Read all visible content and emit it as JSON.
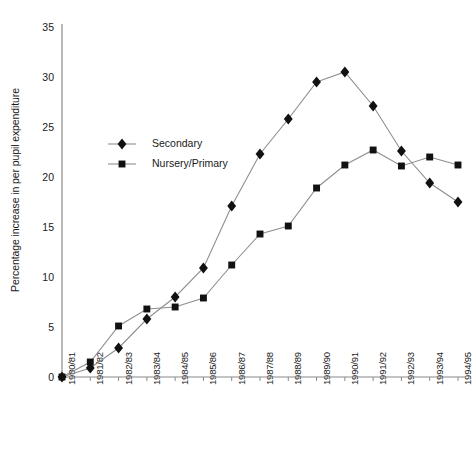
{
  "chart_data": {
    "type": "line",
    "title": "",
    "xlabel": "",
    "ylabel": "Percentage increase in per pupil expenditure",
    "ylim": [
      0,
      35
    ],
    "yticks": [
      0,
      5,
      10,
      15,
      20,
      25,
      30,
      35
    ],
    "grid": false,
    "legend_position": "upper-left-inside",
    "categories": [
      "1980/81",
      "1981/82",
      "1982/83",
      "1983/84",
      "1984/85",
      "1985/86",
      "1986/87",
      "1987/88",
      "1988/89",
      "1989/90",
      "1990/91",
      "1991/92",
      "1992/93",
      "1993/94",
      "1994/95"
    ],
    "series": [
      {
        "name": "Secondary",
        "marker": "diamond",
        "color": "#111111",
        "values": [
          0.0,
          0.9,
          2.9,
          5.8,
          8.0,
          10.9,
          17.1,
          22.3,
          25.8,
          29.5,
          30.5,
          27.1,
          22.6,
          19.4,
          17.5
        ]
      },
      {
        "name": "Nursery/Primary",
        "marker": "square",
        "color": "#111111",
        "values": [
          0.0,
          1.5,
          5.1,
          6.8,
          7.0,
          7.9,
          11.2,
          14.3,
          15.1,
          18.9,
          21.2,
          22.7,
          21.1,
          22.0,
          21.2
        ]
      }
    ],
    "annotations": []
  },
  "legend": {
    "items": [
      {
        "label": "Secondary",
        "marker": "diamond-marker-icon"
      },
      {
        "label": "Nursery/Primary",
        "marker": "square-marker-icon"
      }
    ]
  },
  "axes": {
    "y_title": "Percentage increase in per pupil expenditure",
    "y_tick_labels": [
      "0",
      "5",
      "10",
      "15",
      "20",
      "25",
      "30",
      "35"
    ],
    "x_tick_labels": [
      "1980/81",
      "1981/82",
      "1982/83",
      "1983/84",
      "1984/85",
      "1985/86",
      "1986/87",
      "1987/88",
      "1988/89",
      "1989/90",
      "1990/91",
      "1991/92",
      "1992/93",
      "1993/94",
      "1994/95"
    ]
  },
  "colors": {
    "axis": "#8a8a8a",
    "line": "#8f8f8f",
    "marker": "#111111",
    "text": "#1a1a1a",
    "background": "#ffffff"
  }
}
